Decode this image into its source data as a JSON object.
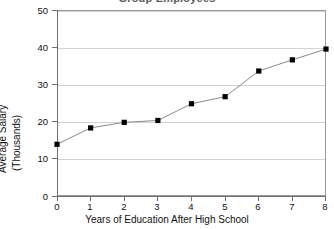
{
  "chart_data": {
    "type": "line",
    "title": "Group Employees",
    "title_note": "top of title row is cropped off by the screenshot edge",
    "xlabel": "Years of Education After High School",
    "ylabel_line1": "Average Salary",
    "ylabel_line2": "(Thousands)",
    "ylabel": "Average Salary (Thousands)",
    "x": [
      0,
      1,
      2,
      3,
      4,
      5,
      6,
      7,
      8
    ],
    "values": [
      13.9,
      18.3,
      19.8,
      20.3,
      24.8,
      26.7,
      33.6,
      36.6,
      39.5
    ],
    "xticks": [
      "0",
      "1",
      "2",
      "3",
      "4",
      "5",
      "6",
      "7",
      "8"
    ],
    "yticks": [
      "0",
      "10",
      "20",
      "30",
      "40",
      "50"
    ],
    "ytick_values": [
      0,
      10,
      20,
      30,
      40,
      50
    ],
    "xlim": [
      0,
      8
    ],
    "ylim": [
      0,
      50
    ],
    "grid": "horizontal",
    "legend": "none",
    "marker": "square",
    "marker_color": "#000000",
    "line_color": "#8a8a8a",
    "gridline_color": "#d2d2d2",
    "axis_color": "#6f6f6f",
    "frame_color": "#9a9a9a",
    "background": "#ffffff"
  }
}
